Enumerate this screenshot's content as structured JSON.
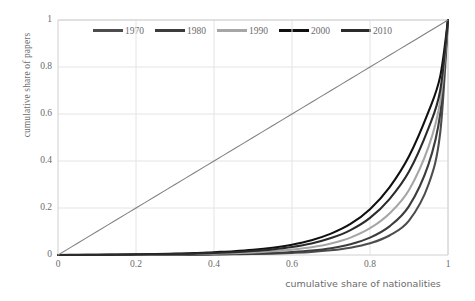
{
  "chart_data": {
    "type": "line",
    "title": "",
    "xlabel": "cumulative share of nationalities",
    "ylabel": "cumulative share of papers",
    "xlim": [
      0,
      1
    ],
    "ylim": [
      0,
      1
    ],
    "xticks": [
      "0",
      "0.2",
      "0.4",
      "0.6",
      "0.8",
      "1"
    ],
    "yticks": [
      "0",
      "0.2",
      "0.4",
      "0.6",
      "0.8",
      "1"
    ],
    "xtick_values": [
      0,
      0.2,
      0.4,
      0.6,
      0.8,
      1
    ],
    "ytick_values": [
      0,
      0.2,
      0.4,
      0.6,
      0.8,
      1
    ],
    "grid": true,
    "legend_position": "top-center",
    "legend": [
      "1970",
      "1980",
      "1990",
      "2000",
      "2010"
    ],
    "colors": {
      "1970": "#4d4d4d",
      "1980": "#3c3c3c",
      "1990": "#a6a6a6",
      "2000": "#101010",
      "2010": "#2b2b2b",
      "equality_line": "#808080",
      "grid": "#e4e4e4",
      "axis": "#d0d0d0",
      "text": "#6b6b6b"
    },
    "x": [
      0,
      0.05,
      0.1,
      0.15,
      0.2,
      0.25,
      0.3,
      0.35,
      0.4,
      0.45,
      0.5,
      0.55,
      0.6,
      0.65,
      0.7,
      0.75,
      0.8,
      0.85,
      0.9,
      0.95,
      0.98,
      1
    ],
    "series": [
      {
        "name": "1970",
        "color": "#4d4d4d",
        "values": [
          0,
          0,
          0,
          0,
          0,
          0,
          0.001,
          0.001,
          0.002,
          0.003,
          0.004,
          0.006,
          0.009,
          0.013,
          0.02,
          0.031,
          0.05,
          0.083,
          0.146,
          0.3,
          0.52,
          1
        ]
      },
      {
        "name": "1980",
        "color": "#3c3c3c",
        "values": [
          0,
          0,
          0,
          0,
          0,
          0.001,
          0.001,
          0.002,
          0.003,
          0.004,
          0.006,
          0.009,
          0.013,
          0.019,
          0.029,
          0.046,
          0.074,
          0.122,
          0.208,
          0.386,
          0.6,
          1
        ]
      },
      {
        "name": "1990",
        "color": "#a6a6a6",
        "values": [
          0,
          0,
          0,
          0.001,
          0.001,
          0.002,
          0.003,
          0.004,
          0.006,
          0.008,
          0.011,
          0.016,
          0.023,
          0.033,
          0.049,
          0.074,
          0.114,
          0.177,
          0.277,
          0.46,
          0.655,
          1
        ]
      },
      {
        "name": "2000",
        "color": "#101010",
        "values": [
          0,
          0.001,
          0.001,
          0.002,
          0.003,
          0.004,
          0.006,
          0.008,
          0.012,
          0.016,
          0.022,
          0.031,
          0.044,
          0.063,
          0.091,
          0.132,
          0.195,
          0.288,
          0.42,
          0.61,
          0.76,
          1
        ]
      },
      {
        "name": "2010",
        "color": "#2b2b2b",
        "values": [
          0,
          0,
          0.001,
          0.001,
          0.002,
          0.003,
          0.004,
          0.006,
          0.009,
          0.012,
          0.017,
          0.024,
          0.034,
          0.049,
          0.072,
          0.106,
          0.158,
          0.238,
          0.355,
          0.54,
          0.7,
          1
        ]
      },
      {
        "name": "equality",
        "color": "#808080",
        "values": [
          0,
          0.05,
          0.1,
          0.15,
          0.2,
          0.25,
          0.3,
          0.35,
          0.4,
          0.45,
          0.5,
          0.55,
          0.6,
          0.65,
          0.7,
          0.75,
          0.8,
          0.85,
          0.9,
          0.95,
          0.98,
          1
        ]
      }
    ]
  }
}
